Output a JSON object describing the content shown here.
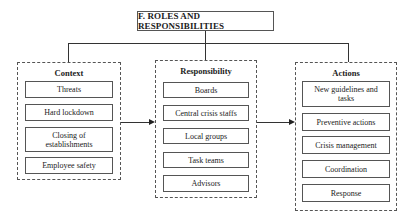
{
  "title": "F. ROLES AND RESPONSIBILITIES",
  "columns": [
    {
      "heading": "Context",
      "items": [
        "Threats",
        "Hard lockdown",
        "Closing of establishments",
        "Employee safety"
      ]
    },
    {
      "heading": "Responsibility",
      "items": [
        "Boards",
        "Central crisis staffs",
        "Local groups",
        "Task teams",
        "Advisors"
      ]
    },
    {
      "heading": "Actions",
      "items": [
        "New guidelines and tasks",
        "Preventive actions",
        "Crisis management",
        "Coordination",
        "Response"
      ]
    }
  ],
  "colors": {
    "line": "#333333",
    "border": "#555555",
    "background": "#ffffff"
  }
}
